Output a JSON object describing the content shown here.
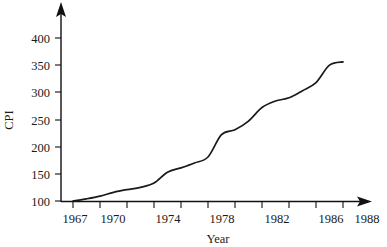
{
  "chart_data": {
    "type": "line",
    "title": "",
    "xlabel": "Year",
    "ylabel": "CPI",
    "xlim": [
      1966,
      1989
    ],
    "ylim": [
      90,
      420
    ],
    "grid": false,
    "legend": null,
    "x_ticks_labeled": [
      1967,
      1970,
      1974,
      1978,
      1982,
      1986,
      1988
    ],
    "x_tick_labels": [
      "1967",
      "1970",
      "1974",
      "1978",
      "1982",
      "1986",
      "1988"
    ],
    "x_ticks_all": [
      1967,
      1969,
      1971,
      1973,
      1975,
      1977,
      1979,
      1981,
      1983,
      1985,
      1987
    ],
    "y_ticks": [
      100,
      150,
      200,
      250,
      300,
      350,
      400
    ],
    "y_tick_labels": [
      "100",
      "150",
      "200",
      "250",
      "300",
      "350",
      "400"
    ],
    "series": [
      {
        "name": "CPI",
        "x": [
          1967,
          1968,
          1969,
          1970,
          1971,
          1972,
          1973,
          1974,
          1975,
          1976,
          1977,
          1978,
          1979,
          1980,
          1981,
          1982,
          1983,
          1984,
          1985,
          1986,
          1987
        ],
        "values": [
          100,
          104,
          109,
          116,
          121,
          125,
          133,
          153,
          161,
          170,
          181,
          222,
          231,
          247,
          272,
          284,
          290,
          303,
          318,
          350,
          356
        ]
      }
    ],
    "colors": {
      "line": "#1a1a1a",
      "axis": "#111111",
      "text": "#1a1a1a",
      "background": "#ffffff"
    }
  },
  "axes": {
    "y_axis_label": "CPI",
    "x_axis_label": "Year"
  }
}
